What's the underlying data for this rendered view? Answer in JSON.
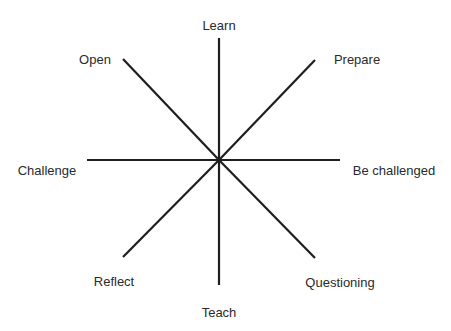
{
  "diagram": {
    "type": "radial-star",
    "center": {
      "x": 219,
      "y": 160
    },
    "line_color": "#1e1e1e",
    "text_color": "#2a2a2a",
    "spokes": [
      {
        "label": "Learn",
        "direction": "up",
        "x1": 219,
        "y1": 38,
        "x2": 219,
        "y2": 160,
        "label_x": 219,
        "label_y": 25
      },
      {
        "label": "Prepare",
        "direction": "up-right",
        "x1": 219,
        "y1": 160,
        "x2": 315,
        "y2": 60,
        "label_x": 357,
        "label_y": 59
      },
      {
        "label": "Be challenged",
        "direction": "right",
        "x1": 219,
        "y1": 160,
        "x2": 340,
        "y2": 160,
        "label_x": 394,
        "label_y": 170
      },
      {
        "label": "Questioning",
        "direction": "down-right",
        "x1": 219,
        "y1": 160,
        "x2": 315,
        "y2": 258,
        "label_x": 340,
        "label_y": 282
      },
      {
        "label": "Teach",
        "direction": "down",
        "x1": 219,
        "y1": 160,
        "x2": 219,
        "y2": 285,
        "label_x": 219,
        "label_y": 312
      },
      {
        "label": "Reflect",
        "direction": "down-left",
        "x1": 219,
        "y1": 160,
        "x2": 123,
        "y2": 257,
        "label_x": 114,
        "label_y": 281
      },
      {
        "label": "Challenge",
        "direction": "left",
        "x1": 87,
        "y1": 160,
        "x2": 219,
        "y2": 160,
        "label_x": 47,
        "label_y": 170
      },
      {
        "label": "Open",
        "direction": "up-left",
        "x1": 123,
        "y1": 59,
        "x2": 219,
        "y2": 160,
        "label_x": 95,
        "label_y": 59
      }
    ]
  }
}
